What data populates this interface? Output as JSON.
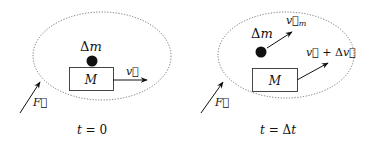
{
  "panels": [
    {
      "name": "initial",
      "caption": "t = 0",
      "mass_label": "Δm",
      "body_label": "M",
      "velocity_label": "v⃗",
      "force_label": "F⃗"
    },
    {
      "name": "after",
      "caption": "t = Δt",
      "mass_label": "Δm",
      "mass_velocity_label": "v⃗m",
      "body_label": "M",
      "velocity_label": "v⃗ + Δv⃗",
      "force_label": "F⃗"
    }
  ]
}
